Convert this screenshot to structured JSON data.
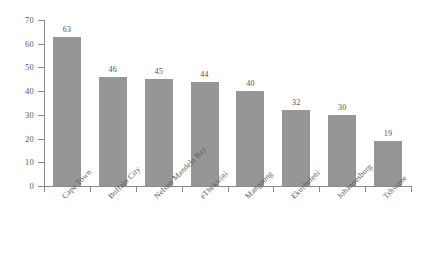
{
  "chart_data": {
    "type": "bar",
    "title": "",
    "subtitle": "",
    "xlabel": "",
    "ylabel": "",
    "categories": [
      "Cape Town",
      "Buffalo City",
      "Nelson Mandela Bay",
      "eThekwini",
      "Mangaung",
      "Ekurhuleni",
      "Johannesburg",
      "Tshwane"
    ],
    "values": [
      63,
      46,
      45,
      44,
      40,
      32,
      30,
      19
    ],
    "value_labels": [
      "63",
      "46",
      "45",
      "44",
      "40",
      "32",
      "30",
      "19"
    ],
    "ylim": [
      0,
      70
    ],
    "ytick_values": [
      0,
      10,
      20,
      30,
      40,
      50,
      60,
      70
    ],
    "ytick_labels": [
      "0",
      "10",
      "20",
      "30",
      "40",
      "50",
      "60",
      "70"
    ],
    "grid": false,
    "legend": false,
    "legend_position": "none",
    "bar_color": "#969696",
    "axis_color": "#8a8a8a",
    "text_color": "#5a5a5a",
    "background_color": "#ffffff",
    "label_rotation_deg": -45
  }
}
